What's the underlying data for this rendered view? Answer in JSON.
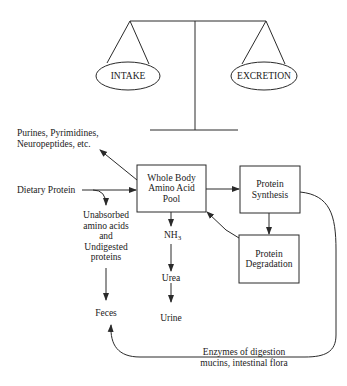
{
  "diagram": {
    "balance": {
      "left_pan": "INTAKE",
      "right_pan": "EXCRETION"
    },
    "nodes": {
      "pool": {
        "line1": "Whole Body",
        "line2": "Amino Acid",
        "line3": "Pool"
      },
      "synthesis": {
        "line1": "Protein",
        "line2": "Synthesis"
      },
      "degradation": {
        "line1": "Protein",
        "line2": "Degradation"
      }
    },
    "labels": {
      "purines_line1": "Purines, Pyrimidines,",
      "purines_line2": "Neuropeptides, etc.",
      "dietary_protein": "Dietary Protein",
      "unabsorbed_line1": "Unabsorbed",
      "unabsorbed_line2": "amino acids",
      "unabsorbed_line3": "and",
      "unabsorbed_line4": "Undigested",
      "unabsorbed_line5": "proteins",
      "nh3_base": "NH",
      "nh3_sub": "3",
      "urea": "Urea",
      "urine": "Urine",
      "feces": "Feces",
      "enzymes_line1": "Enzymes of digestion",
      "enzymes_line2": "mucins, intestinal flora"
    },
    "colors": {
      "stroke": "#2a2a2a",
      "background": "#ffffff"
    }
  }
}
